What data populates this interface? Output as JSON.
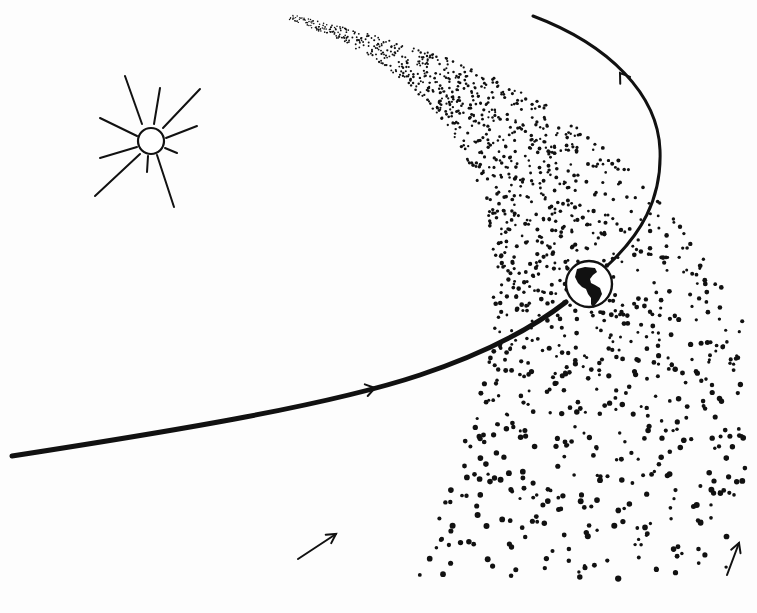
{
  "figure": {
    "width": 757,
    "height": 613,
    "colors": {
      "ink": "#111111",
      "paper": "#fdfdfd"
    }
  },
  "sun": {
    "cx": 151,
    "cy": 141,
    "r": 13,
    "rays": [
      [
        142,
        124,
        125,
        76
      ],
      [
        154,
        124,
        160,
        88
      ],
      [
        163,
        128,
        200,
        89
      ],
      [
        166,
        138,
        197,
        126
      ],
      [
        137,
        136,
        100,
        118
      ],
      [
        137,
        147,
        100,
        158
      ],
      [
        140,
        154,
        95,
        196
      ],
      [
        148,
        156,
        147,
        172
      ],
      [
        157,
        155,
        174,
        207
      ],
      [
        165,
        148,
        177,
        153
      ]
    ]
  },
  "orbit": {
    "lower_path": "M 12 456 C 180 430, 330 405, 420 375 C 480 355, 530 330, 566 302",
    "upper_path": "M 608 265 C 640 235, 662 200, 660 150 C 658 95, 610 45, 533 16",
    "stroke_lower": 5,
    "stroke_upper": 3,
    "arrows": [
      {
        "x": 375,
        "y": 388,
        "angle": -14
      },
      {
        "x": 620,
        "y": 73,
        "angle": -125
      }
    ]
  },
  "earth": {
    "cx": 589,
    "cy": 284,
    "r": 23
  },
  "meteor_stream": {
    "head": {
      "x": 290,
      "y": 17
    },
    "seed": 7,
    "count": 1500
  },
  "direction_arrows": [
    {
      "x1": 298,
      "y1": 559,
      "x2": 336,
      "y2": 534
    },
    {
      "x1": 727,
      "y1": 575,
      "x2": 739,
      "y2": 543
    }
  ]
}
